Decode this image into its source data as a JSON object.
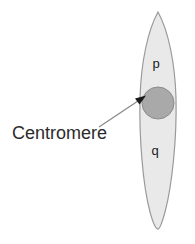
{
  "figure": {
    "background_color": "#ffffff"
  },
  "chromosome": {
    "name": "chromosome",
    "fill_color": "#e9e9e9",
    "stroke_color": "#9a9a9a",
    "arms": [
      {
        "id": "p",
        "label": "p",
        "label_x": 156,
        "label_y": 68
      },
      {
        "id": "q",
        "label": "q",
        "label_y": 155,
        "label_x": 155
      }
    ]
  },
  "centromere": {
    "name": "centromere",
    "fill_color": "#a9a9a9",
    "stroke_color": "#8a8a8a",
    "center_x": 158,
    "center_y": 103,
    "radius": 16
  },
  "callout": {
    "label": "Centromere",
    "text_color": "#2b2b2b",
    "leader_line_color": "#8c8c8c",
    "arrow_color": "#1a1a1a",
    "line_start_x": 99,
    "line_start_y": 127,
    "line_end_x": 144,
    "line_end_y": 97
  }
}
